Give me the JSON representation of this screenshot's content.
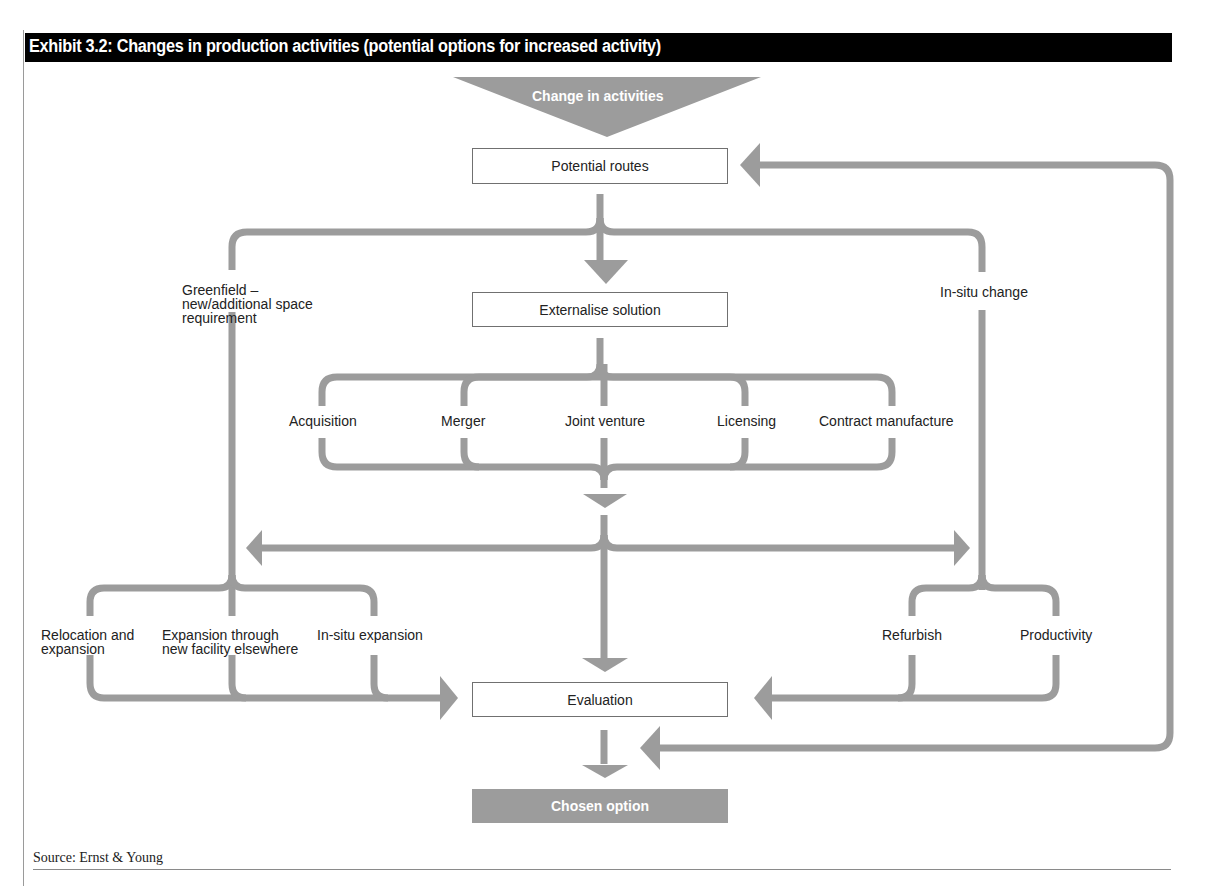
{
  "exhibit": {
    "title": "Exhibit 3.2: Changes in production activities (potential options for increased activity)"
  },
  "colors": {
    "header_bg": "#000000",
    "header_text": "#ffffff",
    "arrow_gray": "#9c9c9c",
    "box_border": "#707070",
    "text": "#222222"
  },
  "nodes": {
    "start": "Change in activities",
    "potential_routes": "Potential routes",
    "externalise_solution": "Externalise solution",
    "evaluation": "Evaluation",
    "chosen_option": "Chosen option"
  },
  "branches": {
    "greenfield": [
      "Greenfield –",
      "new/additional space",
      "requirement"
    ],
    "in_situ_change": "In-situ change"
  },
  "external_options": [
    "Acquisition",
    "Merger",
    "Joint venture",
    "Licensing",
    "Contract manufacture"
  ],
  "greenfield_options": {
    "relocation": [
      "Relocation and",
      "expansion"
    ],
    "new_facility": [
      "Expansion through",
      "new facility elsewhere"
    ],
    "in_situ_expansion": "In-situ expansion"
  },
  "in_situ_options": [
    "Refurbish",
    "Productivity"
  ],
  "footer": {
    "source": "Source: Ernst & Young"
  }
}
